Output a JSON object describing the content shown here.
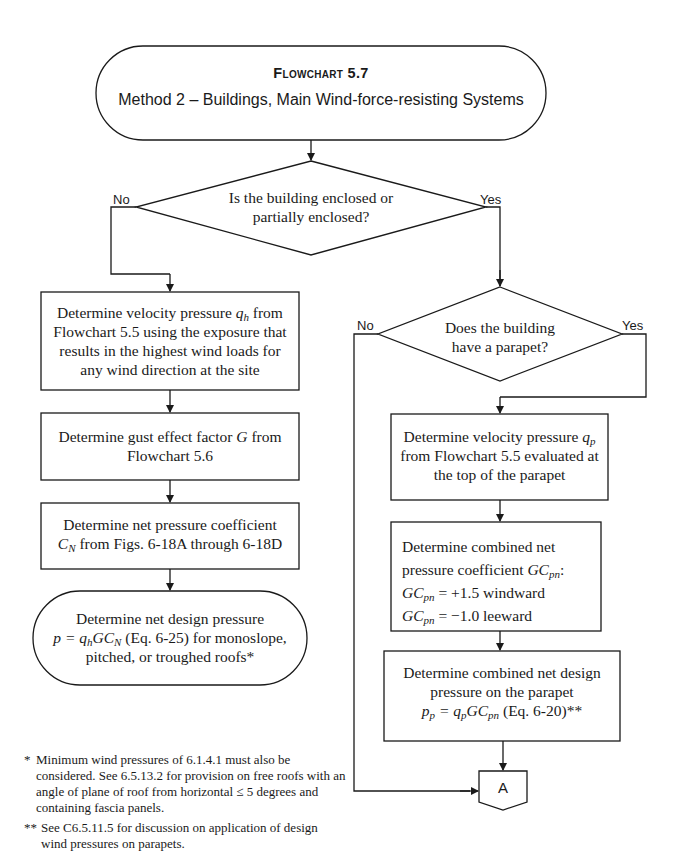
{
  "title": {
    "heading": "Flowchart 5.7",
    "subtitle": "Method 2 – Buildings, Main Wind-force-resisting Systems"
  },
  "decision1": {
    "line1": "Is the building enclosed or",
    "line2": "partially enclosed?",
    "no_label": "No",
    "yes_label": "Yes"
  },
  "left_steps": {
    "velocity": {
      "prefix": "Determine velocity pressure ",
      "var": "q",
      "sub": "h",
      "suffix": " from",
      "line2": "Flowchart 5.5 using the exposure that",
      "line3": "results in the highest wind loads for",
      "line4": "any wind direction at the site"
    },
    "gust": {
      "prefix": "Determine gust effect factor ",
      "var": "G",
      "suffix": " from",
      "line2": "Flowchart 5.6"
    },
    "coefficient": {
      "line1": "Determine net pressure coefficient",
      "var": "C",
      "sub": "N",
      "suffix": " from Figs. 6-18A through 6-18D"
    },
    "design_pressure": {
      "line1": "Determine net design pressure",
      "formula": "p = q",
      "formula_sub1": "h",
      "formula_mid": "GC",
      "formula_sub2": "N",
      "suffix": " (Eq. 6-25) for monoslope,",
      "line3": "pitched, or troughed roofs*"
    }
  },
  "decision2": {
    "line1": "Does the building",
    "line2": "have a parapet?",
    "no_label": "No",
    "yes_label": "Yes"
  },
  "right_steps": {
    "velocity": {
      "prefix": "Determine velocity pressure ",
      "var": "q",
      "sub": "p",
      "line2": "from Flowchart 5.5 evaluated at",
      "line3": "the top of the parapet"
    },
    "combined_coef": {
      "line1": "Determine combined net",
      "line2": "pressure coefficient ",
      "var": "GC",
      "sub": "pn",
      "colon": ":",
      "windward_value": " = +1.5  windward",
      "leeward_value": " = −1.0  leeward"
    },
    "combined_pressure": {
      "line1": "Determine combined net design",
      "line2": "pressure on the parapet",
      "p": "p",
      "p_sub": "p",
      "eq": " = q",
      "q_sub": "p",
      "gc": "GC",
      "gc_sub": "pn",
      "suffix": " (Eq. 6-20)**"
    }
  },
  "connector": {
    "label": "A"
  },
  "footnotes": [
    {
      "marker": "*",
      "lines": [
        "Minimum wind pressures of 6.1.4.1 must also be",
        "considered. See 6.5.13.2 for provision on free roofs with an",
        "angle of plane of roof from horizontal ≤ 5  degrees and",
        "containing fascia panels."
      ]
    },
    {
      "marker": "**",
      "lines": [
        "See C6.5.11.5 for discussion on application of design",
        "wind pressures on parapets."
      ]
    }
  ]
}
